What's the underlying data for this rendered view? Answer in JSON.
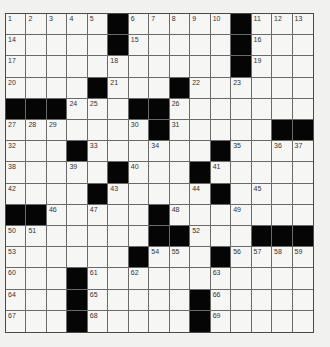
{
  "puzzle": {
    "rows": 15,
    "cols": 15,
    "colors": {
      "block": "#050505",
      "cell": "#f6f6f4",
      "line": "#6a6a6a"
    },
    "grid": [
      "11111#11111#111",
      "11111#11111#111",
      "111111111111#111",
      "1111#111#111111",
      "###111##1111111",
      "1111111#11111##",
      "111#111111#1111",
      "11111#111#11111",
      "1111#11111#1111",
      "##11111#1111111",
      "1111111##111###",
      "111111#111#1111",
      "111#11111111111",
      "111#11111#11111",
      "111#11111#11111"
    ],
    "numbers": [
      [
        0,
        0,
        1
      ],
      [
        0,
        1,
        2
      ],
      [
        0,
        2,
        3
      ],
      [
        0,
        3,
        4
      ],
      [
        0,
        4,
        5
      ],
      [
        0,
        6,
        6
      ],
      [
        0,
        7,
        7
      ],
      [
        0,
        8,
        8
      ],
      [
        0,
        9,
        9
      ],
      [
        0,
        10,
        10
      ],
      [
        0,
        12,
        11
      ],
      [
        0,
        13,
        12
      ],
      [
        0,
        14,
        13
      ],
      [
        1,
        0,
        14
      ],
      [
        1,
        6,
        15
      ],
      [
        1,
        12,
        16
      ],
      [
        2,
        0,
        17
      ],
      [
        2,
        5,
        18
      ],
      [
        2,
        12,
        19
      ],
      [
        3,
        0,
        20
      ],
      [
        3,
        5,
        21
      ],
      [
        3,
        9,
        22
      ],
      [
        3,
        11,
        23
      ],
      [
        4,
        3,
        24
      ],
      [
        4,
        4,
        25
      ],
      [
        4,
        8,
        26
      ],
      [
        5,
        0,
        27
      ],
      [
        5,
        1,
        28
      ],
      [
        5,
        2,
        29
      ],
      [
        5,
        6,
        30
      ],
      [
        5,
        8,
        31
      ],
      [
        6,
        0,
        32
      ],
      [
        6,
        4,
        33
      ],
      [
        6,
        7,
        34
      ],
      [
        6,
        11,
        35
      ],
      [
        6,
        13,
        36
      ],
      [
        6,
        14,
        37
      ],
      [
        7,
        0,
        38
      ],
      [
        7,
        3,
        39
      ],
      [
        7,
        6,
        40
      ],
      [
        7,
        10,
        41
      ],
      [
        8,
        0,
        42
      ],
      [
        8,
        5,
        43
      ],
      [
        8,
        9,
        44
      ],
      [
        8,
        12,
        45
      ],
      [
        9,
        2,
        46
      ],
      [
        9,
        4,
        47
      ],
      [
        9,
        8,
        48
      ],
      [
        9,
        11,
        49
      ],
      [
        10,
        0,
        50
      ],
      [
        10,
        1,
        51
      ],
      [
        10,
        9,
        52
      ],
      [
        11,
        0,
        53
      ],
      [
        11,
        7,
        54
      ],
      [
        11,
        8,
        55
      ],
      [
        11,
        11,
        56
      ],
      [
        11,
        12,
        57
      ],
      [
        11,
        13,
        58
      ],
      [
        11,
        14,
        59
      ],
      [
        12,
        0,
        60
      ],
      [
        12,
        4,
        61
      ],
      [
        12,
        6,
        62
      ],
      [
        12,
        10,
        63
      ],
      [
        13,
        0,
        64
      ],
      [
        13,
        4,
        65
      ],
      [
        13,
        10,
        66
      ],
      [
        14,
        0,
        67
      ],
      [
        14,
        4,
        68
      ],
      [
        14,
        10,
        69
      ]
    ]
  }
}
